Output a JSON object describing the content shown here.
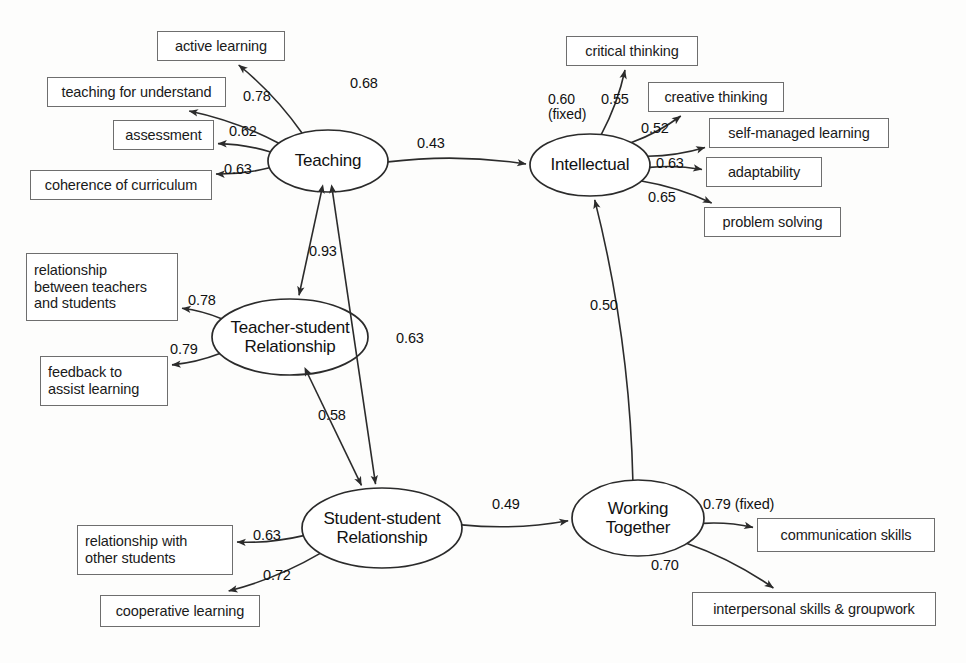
{
  "diagram": {
    "type": "sem-path-diagram",
    "background_color": "#fdfdfc",
    "line_color": "#333333",
    "box_border_color": "#6e6e6e"
  },
  "latent_variables": [
    {
      "id": "teaching",
      "label": "Teaching",
      "cx": 328,
      "cy": 161,
      "rx": 60,
      "ry": 31
    },
    {
      "id": "intellectual",
      "label": "Intellectual",
      "cx": 590,
      "cy": 165,
      "rx": 60,
      "ry": 31
    },
    {
      "id": "teacher_student",
      "label": "Teacher-student\nRelationship",
      "cx": 290,
      "cy": 337,
      "rx": 78,
      "ry": 38
    },
    {
      "id": "student_student",
      "label": "Student-student\nRelationship",
      "cx": 382,
      "cy": 528,
      "rx": 80,
      "ry": 40
    },
    {
      "id": "working_together",
      "label": "Working\nTogether",
      "cx": 638,
      "cy": 518,
      "rx": 66,
      "ry": 38
    }
  ],
  "observed_variables": [
    {
      "id": "active_learning",
      "label": "active learning",
      "x": 157,
      "y": 31,
      "w": 128,
      "h": 30,
      "align": "center"
    },
    {
      "id": "teaching_understand",
      "label": "teaching for understand",
      "x": 47,
      "y": 77,
      "w": 179,
      "h": 30,
      "align": "center"
    },
    {
      "id": "assessment",
      "label": "assessment",
      "x": 113,
      "y": 120,
      "w": 101,
      "h": 30,
      "align": "center"
    },
    {
      "id": "coherence_curriculum",
      "label": "coherence of curriculum",
      "x": 30,
      "y": 170,
      "w": 182,
      "h": 30,
      "align": "center"
    },
    {
      "id": "critical_thinking",
      "label": "critical thinking",
      "x": 566,
      "y": 36,
      "w": 132,
      "h": 30,
      "align": "center"
    },
    {
      "id": "creative_thinking",
      "label": "creative thinking",
      "x": 648,
      "y": 82,
      "w": 136,
      "h": 30,
      "align": "center"
    },
    {
      "id": "self_managed_learning",
      "label": "self-managed learning",
      "x": 709,
      "y": 118,
      "w": 180,
      "h": 30,
      "align": "center"
    },
    {
      "id": "adaptability",
      "label": "adaptability",
      "x": 706,
      "y": 157,
      "w": 116,
      "h": 30,
      "align": "center"
    },
    {
      "id": "problem_solving",
      "label": "problem solving",
      "x": 704,
      "y": 207,
      "w": 137,
      "h": 30,
      "align": "center"
    },
    {
      "id": "rel_teachers_students",
      "label": "relationship\nbetween teachers\nand students",
      "x": 26,
      "y": 253,
      "w": 152,
      "h": 68,
      "align": "left"
    },
    {
      "id": "feedback_assist",
      "label": "feedback to\nassist learning",
      "x": 40,
      "y": 356,
      "w": 128,
      "h": 50,
      "align": "left"
    },
    {
      "id": "rel_other_students",
      "label": "relationship with\nother students",
      "x": 77,
      "y": 525,
      "w": 156,
      "h": 50,
      "align": "left"
    },
    {
      "id": "cooperative_learning",
      "label": "cooperative learning",
      "x": 100,
      "y": 595,
      "w": 160,
      "h": 32,
      "align": "center"
    },
    {
      "id": "communication_skills",
      "label": "communication skills",
      "x": 757,
      "y": 518,
      "w": 178,
      "h": 34,
      "align": "center"
    },
    {
      "id": "interpersonal_skills",
      "label": "interpersonal skills & groupwork",
      "x": 692,
      "y": 592,
      "w": 244,
      "h": 34,
      "align": "center"
    }
  ],
  "measurement_paths": [
    {
      "id": "teaching_active_learning",
      "from": "teaching",
      "to": "active_learning",
      "coefficient": "0.68",
      "label_x": 350,
      "label_y": 76,
      "arrow": "single"
    },
    {
      "id": "teaching_understand",
      "from": "teaching",
      "to": "teaching_understand",
      "coefficient": "0.78",
      "label_x": 243,
      "label_y": 89,
      "arrow": "single"
    },
    {
      "id": "teaching_assessment",
      "from": "teaching",
      "to": "assessment",
      "coefficient": "0.62",
      "label_x": 229,
      "label_y": 124,
      "arrow": "single"
    },
    {
      "id": "teaching_coherence",
      "from": "teaching",
      "to": "coherence_curriculum",
      "coefficient": "0.63",
      "label_x": 224,
      "label_y": 162,
      "arrow": "single"
    },
    {
      "id": "intellectual_critical",
      "from": "intellectual",
      "to": "critical_thinking",
      "coefficient": "0.60\n(fixed)",
      "label_x": 548,
      "label_y": 92,
      "arrow": "single"
    },
    {
      "id": "intellectual_creative",
      "from": "intellectual",
      "to": "creative_thinking",
      "coefficient": "0.55",
      "label_x": 601,
      "label_y": 92,
      "arrow": "single"
    },
    {
      "id": "intellectual_self_managed",
      "from": "intellectual",
      "to": "self_managed_learning",
      "coefficient": "0.52",
      "label_x": 641,
      "label_y": 121,
      "arrow": "single"
    },
    {
      "id": "intellectual_adaptability",
      "from": "intellectual",
      "to": "adaptability",
      "coefficient": "0.63",
      "label_x": 656,
      "label_y": 156,
      "arrow": "single"
    },
    {
      "id": "intellectual_problem_solving",
      "from": "intellectual",
      "to": "problem_solving",
      "coefficient": "0.65",
      "label_x": 648,
      "label_y": 190,
      "arrow": "single"
    },
    {
      "id": "ts_rel_teachers_students",
      "from": "teacher_student",
      "to": "rel_teachers_students",
      "coefficient": "0.78",
      "label_x": 188,
      "label_y": 293,
      "arrow": "single"
    },
    {
      "id": "ts_feedback",
      "from": "teacher_student",
      "to": "feedback_assist",
      "coefficient": "0.79",
      "label_x": 170,
      "label_y": 342,
      "arrow": "single"
    },
    {
      "id": "ss_rel_other_students",
      "from": "student_student",
      "to": "rel_other_students",
      "coefficient": "0.63",
      "label_x": 253,
      "label_y": 528,
      "arrow": "single"
    },
    {
      "id": "ss_cooperative_learning",
      "from": "student_student",
      "to": "cooperative_learning",
      "coefficient": "0.72",
      "label_x": 263,
      "label_y": 568,
      "arrow": "single"
    },
    {
      "id": "wt_communication",
      "from": "working_together",
      "to": "communication_skills",
      "coefficient": "0.79 (fixed)",
      "label_x": 703,
      "label_y": 497,
      "arrow": "single"
    },
    {
      "id": "wt_interpersonal",
      "from": "working_together",
      "to": "interpersonal_skills",
      "coefficient": "0.70",
      "label_x": 651,
      "label_y": 558,
      "arrow": "single"
    }
  ],
  "structural_paths": [
    {
      "id": "teaching_to_intellectual",
      "from": "teaching",
      "to": "intellectual",
      "coefficient": "0.43",
      "label_x": 417,
      "label_y": 136,
      "arrow": "single"
    },
    {
      "id": "teaching_teacher_student",
      "from": "teaching",
      "to": "teacher_student",
      "coefficient": "0.93",
      "label_x": 309,
      "label_y": 244,
      "arrow": "double"
    },
    {
      "id": "teaching_student_student",
      "from": "teaching",
      "to": "student_student",
      "coefficient": "0.63",
      "label_x": 396,
      "label_y": 331,
      "arrow": "double"
    },
    {
      "id": "teacher_student_student_student",
      "from": "teacher_student",
      "to": "student_student",
      "coefficient": "0.58",
      "label_x": 318,
      "label_y": 408,
      "arrow": "double"
    },
    {
      "id": "student_student_to_working",
      "from": "student_student",
      "to": "working_together",
      "coefficient": "0.49",
      "label_x": 492,
      "label_y": 497,
      "arrow": "single"
    },
    {
      "id": "working_to_intellectual",
      "from": "working_together",
      "to": "intellectual",
      "coefficient": "0.50",
      "label_x": 590,
      "label_y": 298,
      "arrow": "single"
    }
  ]
}
